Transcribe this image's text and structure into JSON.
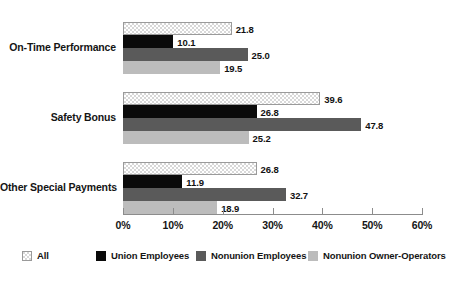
{
  "chart_data": {
    "type": "bar",
    "orientation": "horizontal",
    "title": "",
    "subtitle": "",
    "xlabel": "",
    "ylabel": "",
    "xlim": [
      0,
      60
    ],
    "xtick_values": [
      0,
      10,
      20,
      30,
      40,
      50,
      60
    ],
    "xtick_labels": [
      "0%",
      "10%",
      "20%",
      "30%",
      "40%",
      "50%",
      "60%"
    ],
    "grid": false,
    "legend_position": "bottom",
    "categories": [
      "On-Time Performance",
      "Safety Bonus",
      "Other Special Payments"
    ],
    "series": [
      {
        "name": "All",
        "color": "#d8d8d8",
        "pattern": "checkered",
        "values": [
          21.8,
          39.6,
          26.8
        ],
        "labels": [
          "21.8",
          "39.6",
          "26.8"
        ]
      },
      {
        "name": "Union Employees",
        "color": "#0a0a0a",
        "pattern": "solid",
        "values": [
          10.1,
          26.8,
          11.9
        ],
        "labels": [
          "10.1",
          "26.8",
          "11.9"
        ]
      },
      {
        "name": "Nonunion Employees",
        "color": "#5a5a5a",
        "pattern": "solid",
        "values": [
          25.0,
          47.8,
          32.7
        ],
        "labels": [
          "25.0",
          "47.8",
          "32.7"
        ]
      },
      {
        "name": "Nonunion Owner-Operators",
        "color": "#bcbcbc",
        "pattern": "solid",
        "values": [
          19.5,
          25.2,
          18.9
        ],
        "labels": [
          "19.5",
          "25.2",
          "18.9"
        ]
      }
    ]
  },
  "legend": {
    "items": [
      {
        "label": "All",
        "swatch": "legend-swatch-all"
      },
      {
        "label": "Union Employees",
        "swatch": "legend-swatch-union-employees"
      },
      {
        "label": "Nonunion Employees",
        "swatch": "legend-swatch-nonunion-employees"
      },
      {
        "label": "Nonunion Owner-Operators",
        "swatch": "legend-swatch-nonunion-owner-operators"
      }
    ]
  }
}
